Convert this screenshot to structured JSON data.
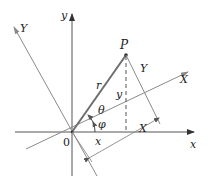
{
  "diagram": {
    "type": "rotation-of-axes",
    "colors": {
      "axis": "#555555",
      "rotated_axis": "#8a8a8a",
      "vector": "#6e6e6e",
      "text": "#222222"
    },
    "labels": {
      "x_axis": "x",
      "y_axis": "y",
      "X_axis": "X",
      "Y_axis": "Y",
      "origin": "0",
      "point": "P",
      "radius": "r",
      "theta": "θ",
      "phi": "φ",
      "x_coord": "x",
      "y_coord": "y",
      "X_coord": "X",
      "Y_coord": "Y"
    }
  }
}
